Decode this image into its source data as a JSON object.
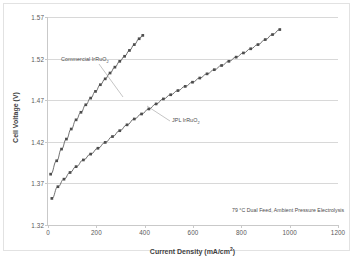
{
  "chart_data": {
    "type": "line",
    "title": "",
    "xlabel": "Current Density (mA/cm²)",
    "ylabel": "Cell Voltage (V)",
    "xlim": [
      0,
      1200
    ],
    "ylim": [
      1.32,
      1.57
    ],
    "xticks": [
      0,
      200,
      400,
      600,
      800,
      1000,
      1200
    ],
    "yticks": [
      1.32,
      1.37,
      1.42,
      1.47,
      1.52,
      1.57
    ],
    "grid": "horizontal",
    "legend": "inline-annotations",
    "marker": "filled-square",
    "series": [
      {
        "name": "Commercial IrRuO2",
        "label_html": "Commercial IrRuO<sub>2</sub>",
        "color": "#4d4d4d",
        "x": [
          15,
          40,
          60,
          80,
          100,
          120,
          140,
          160,
          180,
          200,
          220,
          240,
          260,
          280,
          300,
          320,
          340,
          360,
          380,
          395
        ],
        "y": [
          1.382,
          1.398,
          1.412,
          1.424,
          1.436,
          1.447,
          1.456,
          1.465,
          1.473,
          1.481,
          1.489,
          1.496,
          1.503,
          1.51,
          1.517,
          1.523,
          1.53,
          1.537,
          1.544,
          1.548
        ]
      },
      {
        "name": "JPL IrRuO2",
        "label_html": "JPL IrRuO<sub>2</sub>",
        "color": "#4d4d4d",
        "x": [
          20,
          45,
          70,
          95,
          120,
          150,
          180,
          210,
          240,
          270,
          300,
          330,
          360,
          390,
          420,
          450,
          480,
          510,
          540,
          570,
          600,
          630,
          660,
          690,
          720,
          750,
          780,
          810,
          840,
          870,
          900,
          930,
          960
        ],
        "y": [
          1.353,
          1.367,
          1.376,
          1.384,
          1.391,
          1.399,
          1.406,
          1.413,
          1.42,
          1.427,
          1.434,
          1.441,
          1.448,
          1.454,
          1.46,
          1.466,
          1.472,
          1.477,
          1.482,
          1.487,
          1.492,
          1.497,
          1.502,
          1.507,
          1.512,
          1.517,
          1.522,
          1.527,
          1.532,
          1.537,
          1.543,
          1.549,
          1.555
        ]
      }
    ],
    "annotations": [
      {
        "name": "conditions",
        "text": "79 °C Dual Feed, Ambient Pressure Electrolysis"
      }
    ],
    "leader_lines": [
      {
        "name": "commercial-leader",
        "from": [
          95,
          60
        ],
        "to": [
          119,
          93
        ]
      },
      {
        "name": "jpl-leader",
        "from": [
          166,
          117
        ],
        "to": [
          143,
          102
        ]
      }
    ]
  }
}
